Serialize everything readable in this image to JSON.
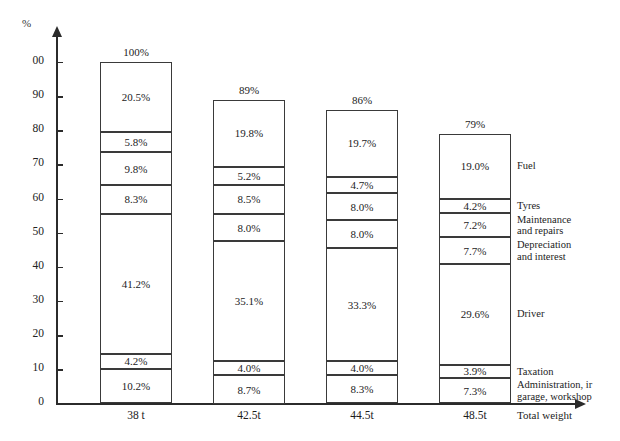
{
  "chart_data": {
    "type": "bar",
    "subtype": "stacked-bar",
    "title": "",
    "xlabel": "Total weight",
    "ylabel": "%",
    "ylim": [
      0,
      100
    ],
    "grid": false,
    "legend_position": "right-inline",
    "y_ticks": [
      "0",
      "10",
      "20",
      "30",
      "40",
      "50",
      "60",
      "70",
      "80",
      "90",
      "00"
    ],
    "y_tick_values": [
      0,
      10,
      20,
      30,
      40,
      50,
      60,
      70,
      80,
      90,
      100
    ],
    "categories": [
      "38 t",
      "42.5t",
      "44.5t",
      "48.5t"
    ],
    "bar_totals": [
      "100%",
      "89%",
      "86%",
      "79%"
    ],
    "bar_total_values": [
      100,
      89,
      86,
      79
    ],
    "series": [
      {
        "name": "Fuel",
        "values": [
          20.5,
          19.8,
          19.7,
          19.0
        ],
        "labels": [
          "20.5%",
          "19.8%",
          "19.7%",
          "19.0%"
        ]
      },
      {
        "name": "Tyres",
        "values": [
          5.8,
          5.2,
          4.7,
          4.2
        ],
        "labels": [
          "5.8%",
          "5.2%",
          "4.7%",
          "4.2%"
        ]
      },
      {
        "name": "Maintenance\nand repairs",
        "values": [
          9.8,
          8.5,
          8.0,
          7.2
        ],
        "labels": [
          "9.8%",
          "8.5%",
          "8.0%",
          "7.2%"
        ]
      },
      {
        "name": "Depreciation\nand interest",
        "values": [
          8.3,
          8.0,
          8.0,
          7.7
        ],
        "labels": [
          "8.3%",
          "8.0%",
          "8.0%",
          "7.7%"
        ]
      },
      {
        "name": "Driver",
        "values": [
          41.2,
          35.1,
          33.3,
          29.6
        ],
        "labels": [
          "41.2%",
          "35.1%",
          "33.3%",
          "29.6%"
        ]
      },
      {
        "name": "Taxation",
        "values": [
          4.2,
          4.0,
          4.0,
          3.9
        ],
        "labels": [
          "4.2%",
          "4.0%",
          "4.0%",
          "3.9%"
        ]
      },
      {
        "name": "Administration, ir\ngarage, workshop",
        "values": [
          10.2,
          8.7,
          8.3,
          7.3
        ],
        "labels": [
          "10.2%",
          "8.7%",
          "8.3%",
          "7.3%"
        ]
      }
    ],
    "legend_entries": [
      "Fuel",
      "Tyres",
      "Maintenance\nand repairs",
      "Depreciation\nand interest",
      "Driver",
      "Taxation",
      "Administration, ir\ngarage, workshop"
    ],
    "colors": {
      "segment_fill": "#ffffff",
      "segment_border": "#3a3a3a",
      "axis": "#2b2b2b",
      "text": "#1c1c1c",
      "background": "#ffffff"
    }
  }
}
